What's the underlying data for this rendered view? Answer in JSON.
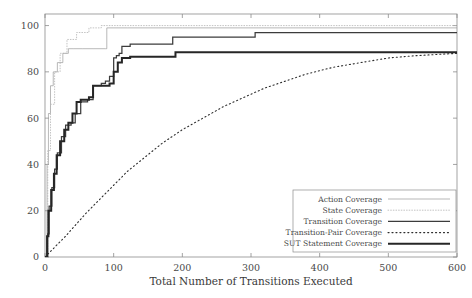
{
  "chart_data": {
    "type": "line",
    "title": "",
    "xlabel": "Total Number of Transitions Executed",
    "ylabel": "",
    "xlim": [
      0,
      600
    ],
    "ylim": [
      0,
      105
    ],
    "grid": false,
    "legend_position": "bottom-right",
    "xticks": [
      "0",
      "100",
      "200",
      "300",
      "400",
      "500",
      "600"
    ],
    "xtick_values": [
      0,
      100,
      200,
      300,
      400,
      500,
      600
    ],
    "yticks": [
      "0",
      "20",
      "40",
      "60",
      "80",
      "100"
    ],
    "ytick_values": [
      0,
      20,
      40,
      60,
      80,
      100
    ],
    "series": [
      {
        "name": "Action Coverage",
        "style": "solid-thin",
        "color": "#9a9a9a",
        "width": 0.7,
        "step": true,
        "x": [
          0,
          3,
          5,
          8,
          12,
          18,
          26,
          34,
          42,
          55,
          70,
          88,
          90,
          120,
          200,
          300,
          420,
          600
        ],
        "values": [
          0,
          40,
          62,
          74,
          80,
          84,
          88,
          90,
          90,
          90,
          90,
          90,
          99,
          99,
          99,
          99,
          99,
          99
        ]
      },
      {
        "name": "State Coverage",
        "style": "dotted-thin",
        "color": "#b4b4b4",
        "width": 0.8,
        "step": true,
        "x": [
          0,
          4,
          8,
          14,
          22,
          32,
          46,
          64,
          82,
          100,
          150,
          250,
          400,
          600
        ],
        "values": [
          0,
          46,
          66,
          80,
          88,
          94,
          97,
          99,
          100,
          100,
          100,
          100,
          100,
          100
        ]
      },
      {
        "name": "Transition Coverage",
        "style": "solid-medium",
        "color": "#3c3c3c",
        "width": 1.25,
        "step": true,
        "x": [
          0,
          4,
          6,
          10,
          14,
          18,
          24,
          30,
          38,
          44,
          52,
          58,
          62,
          70,
          76,
          82,
          88,
          94,
          100,
          104,
          108,
          112,
          118,
          124,
          130,
          160,
          180,
          186,
          200,
          260,
          300,
          306,
          400,
          500,
          600
        ],
        "values": [
          0,
          10,
          22,
          30,
          38,
          45,
          52,
          57,
          58,
          62,
          67,
          67,
          68,
          74,
          74,
          75,
          76,
          78,
          86,
          87,
          88,
          91,
          91,
          92,
          92,
          92,
          92,
          95,
          95,
          95,
          95,
          97,
          97,
          97,
          97
        ]
      },
      {
        "name": "Transition-Pair Coverage",
        "style": "dotted-medium",
        "color": "#2e2e2e",
        "width": 1.1,
        "step": false,
        "x": [
          0,
          10,
          20,
          30,
          45,
          60,
          80,
          100,
          120,
          145,
          170,
          200,
          230,
          260,
          290,
          320,
          350,
          380,
          420,
          460,
          500,
          540,
          570,
          600
        ],
        "values": [
          0,
          3,
          6,
          9,
          14,
          19,
          25,
          31,
          37,
          43,
          49,
          55,
          60,
          65,
          69,
          73,
          76,
          79,
          82,
          84,
          86,
          87,
          87.5,
          88
        ]
      },
      {
        "name": "SUT Statement Coverage",
        "style": "solid-thick",
        "color": "#262626",
        "width": 2.0,
        "step": true,
        "x": [
          0,
          3,
          5,
          9,
          13,
          17,
          22,
          28,
          34,
          40,
          46,
          52,
          58,
          64,
          70,
          76,
          82,
          88,
          94,
          100,
          106,
          112,
          118,
          124,
          130,
          150,
          180,
          190,
          220,
          300,
          400,
          500,
          600
        ],
        "values": [
          0,
          9,
          20,
          29,
          36,
          44,
          50,
          55,
          58,
          62,
          67,
          68,
          68,
          69,
          74,
          74,
          74,
          74,
          75,
          80,
          84,
          86,
          86,
          86.5,
          86.5,
          86.5,
          86.5,
          88.5,
          88.5,
          88.5,
          88.5,
          88.5,
          88.5
        ]
      }
    ]
  },
  "legend": {
    "entries": [
      {
        "label": "Action Coverage"
      },
      {
        "label": "State Coverage"
      },
      {
        "label": "Transition Coverage"
      },
      {
        "label": "Transition-Pair Coverage"
      },
      {
        "label": "SUT Statement Coverage"
      }
    ]
  }
}
